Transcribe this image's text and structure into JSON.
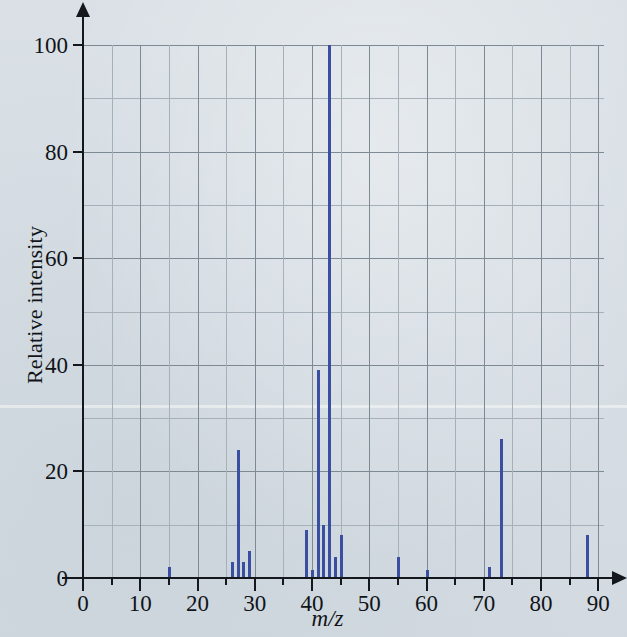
{
  "figure": {
    "background_color": "#d6dde3",
    "peak_color": "#3b4fa0",
    "grid_color": "#7e8a93",
    "axis_color": "#14181c"
  },
  "axes": {
    "x_title": "m/z",
    "y_title": "Relative intensity",
    "x_ticks": [
      0,
      10,
      20,
      30,
      40,
      50,
      60,
      70,
      80,
      90
    ],
    "y_ticks": [
      0,
      20,
      40,
      60,
      80,
      100
    ],
    "x_minor_step": 5,
    "y_minor_step": 10
  },
  "chart_data": {
    "type": "bar",
    "title": "",
    "subtitle": "",
    "xlabel": "m/z",
    "ylabel": "Relative intensity",
    "xlim": [
      0,
      91
    ],
    "ylim": [
      0,
      100
    ],
    "grid": true,
    "legend": "none",
    "x": [
      15,
      26,
      27,
      28,
      29,
      39,
      40,
      41,
      42,
      43,
      44,
      45,
      55,
      60,
      71,
      73,
      88
    ],
    "values": [
      2,
      3,
      24,
      3,
      5,
      9,
      1.5,
      39,
      10,
      100,
      4,
      8,
      4,
      1.5,
      2,
      26,
      8
    ],
    "categories": [
      "15",
      "26",
      "27",
      "28",
      "29",
      "39",
      "40",
      "41",
      "42",
      "43",
      "44",
      "45",
      "55",
      "60",
      "71",
      "73",
      "88"
    ],
    "base_peak_mz": 43,
    "base_peak_intensity": 100,
    "molecular_ion_mz": 88
  }
}
